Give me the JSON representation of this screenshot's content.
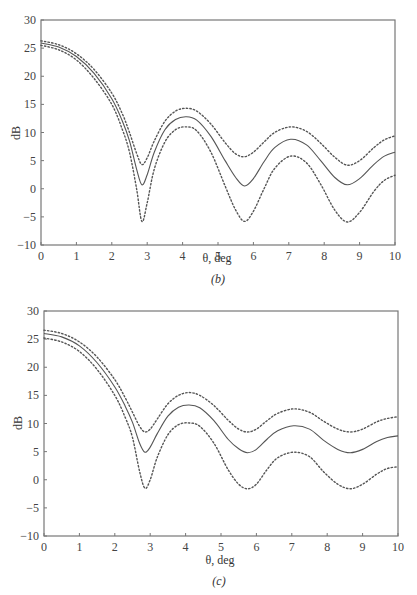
{
  "charts": [
    {
      "panel_label": "(b)",
      "xlabel": "θ, deg",
      "ylabel": "dB",
      "x_ticks": [
        "0",
        "1",
        "2",
        "3",
        "4",
        "5",
        "6",
        "7",
        "8",
        "9",
        "10"
      ],
      "y_ticks": [
        "30",
        "25",
        "20",
        "15",
        "10",
        "5",
        "0",
        "−5",
        "−10"
      ]
    },
    {
      "panel_label": "(c)",
      "xlabel": "θ, deg",
      "ylabel": "dB",
      "x_ticks": [
        "0",
        "1",
        "2",
        "3",
        "4",
        "5",
        "6",
        "7",
        "8",
        "9",
        "10"
      ],
      "y_ticks": [
        "30",
        "25",
        "20",
        "15",
        "10",
        "5",
        "0",
        "−5",
        "−10"
      ]
    }
  ],
  "chart_data": [
    {
      "type": "line",
      "title": "(b)",
      "xlabel": "θ, deg",
      "ylabel": "dB",
      "xlim": [
        0,
        10
      ],
      "ylim": [
        -10,
        30
      ],
      "grid": false,
      "legend": null,
      "x": [
        0,
        0.5,
        1.0,
        1.5,
        2.0,
        2.3,
        2.5,
        2.7,
        2.85,
        3.0,
        3.2,
        3.5,
        3.8,
        4.1,
        4.4,
        4.8,
        5.2,
        5.5,
        5.75,
        6.0,
        6.3,
        6.6,
        7.05,
        7.5,
        7.9,
        8.3,
        8.65,
        9.0,
        9.4,
        9.7,
        10.0
      ],
      "series": [
        {
          "name": "upper bound (dotted)",
          "style": "dotted",
          "values": [
            26.3,
            25.6,
            24.0,
            21.2,
            17.0,
            13.3,
            10.0,
            6.3,
            4.3,
            5.5,
            8.5,
            12.0,
            13.8,
            14.3,
            13.8,
            11.5,
            8.2,
            6.2,
            5.7,
            6.5,
            8.3,
            10.0,
            11.0,
            10.2,
            8.1,
            5.6,
            4.2,
            5.0,
            7.3,
            8.7,
            9.4
          ]
        },
        {
          "name": "nominal (solid)",
          "style": "solid",
          "values": [
            25.9,
            25.2,
            23.5,
            20.5,
            16.0,
            12.0,
            8.5,
            3.5,
            0.7,
            2.5,
            6.5,
            10.5,
            12.3,
            12.8,
            12.2,
            9.3,
            5.0,
            2.0,
            0.5,
            1.8,
            4.8,
            7.3,
            8.8,
            7.8,
            5.0,
            2.0,
            0.7,
            1.8,
            4.3,
            5.8,
            6.5
          ]
        },
        {
          "name": "lower bound (dotted)",
          "style": "dotted",
          "values": [
            25.5,
            24.7,
            22.9,
            19.6,
            15.0,
            10.5,
            6.5,
            0.0,
            -5.8,
            -2.5,
            3.5,
            8.3,
            10.5,
            11.0,
            10.3,
            6.5,
            0.5,
            -3.8,
            -5.8,
            -4.0,
            0.0,
            3.6,
            5.8,
            4.6,
            0.8,
            -3.8,
            -5.9,
            -4.2,
            -0.5,
            1.5,
            2.4
          ]
        }
      ]
    },
    {
      "type": "line",
      "title": "(c)",
      "xlabel": "θ, deg",
      "ylabel": "dB",
      "xlim": [
        0,
        10
      ],
      "ylim": [
        -10,
        30
      ],
      "grid": false,
      "legend": null,
      "x": [
        0,
        0.5,
        1.0,
        1.5,
        2.0,
        2.3,
        2.5,
        2.7,
        2.85,
        3.0,
        3.2,
        3.5,
        3.8,
        4.1,
        4.4,
        4.8,
        5.2,
        5.5,
        5.75,
        6.0,
        6.3,
        6.6,
        7.05,
        7.5,
        7.9,
        8.3,
        8.65,
        9.0,
        9.4,
        9.7,
        10.0
      ],
      "series": [
        {
          "name": "upper bound (dotted)",
          "style": "dotted",
          "values": [
            26.6,
            26.0,
            24.5,
            21.8,
            17.8,
            14.5,
            12.0,
            9.5,
            8.5,
            9.0,
            10.8,
            13.5,
            15.0,
            15.5,
            15.0,
            13.2,
            10.6,
            9.0,
            8.5,
            9.0,
            10.5,
            11.8,
            12.6,
            12.0,
            10.4,
            9.0,
            8.5,
            9.0,
            10.3,
            10.9,
            11.2
          ]
        },
        {
          "name": "nominal (solid)",
          "style": "solid",
          "values": [
            26.0,
            25.4,
            23.8,
            20.8,
            16.5,
            13.0,
            10.2,
            6.5,
            4.9,
            5.8,
            8.2,
            11.3,
            12.9,
            13.3,
            12.8,
            10.5,
            7.2,
            5.5,
            4.8,
            5.4,
            7.2,
            8.7,
            9.6,
            9.0,
            7.0,
            5.4,
            4.8,
            5.4,
            6.8,
            7.5,
            7.8
          ]
        },
        {
          "name": "lower bound (dotted)",
          "style": "dotted",
          "values": [
            25.2,
            24.5,
            22.8,
            19.6,
            15.0,
            11.0,
            7.5,
            1.5,
            -1.5,
            0.0,
            4.0,
            8.0,
            9.8,
            10.1,
            9.5,
            6.5,
            1.8,
            -0.8,
            -1.6,
            -0.8,
            1.8,
            3.9,
            4.9,
            4.1,
            1.4,
            -0.8,
            -1.6,
            -0.8,
            1.0,
            2.0,
            2.3
          ]
        }
      ]
    }
  ]
}
